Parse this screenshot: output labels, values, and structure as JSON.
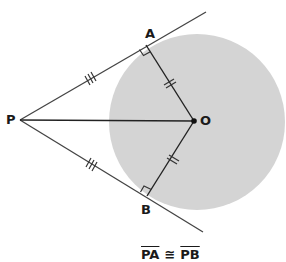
{
  "diagram": {
    "points": {
      "P": {
        "label": "P",
        "x": 20,
        "y": 120
      },
      "A": {
        "label": "A",
        "x": 146,
        "y": 45
      },
      "B": {
        "label": "B",
        "x": 147,
        "y": 196
      },
      "O": {
        "label": "O",
        "x": 194,
        "y": 121
      }
    },
    "circle": {
      "cx": 197,
      "cy": 122,
      "r": 88,
      "fill": "#d4d4d4"
    },
    "tangent_upper_end": {
      "x": 206,
      "y": 12
    },
    "tangent_lower_end": {
      "x": 203,
      "y": 232
    },
    "line_color": "#333333",
    "marks": {
      "PA": "triple-tick",
      "PB": "triple-tick",
      "OA": "double-tick",
      "OB": "double-tick",
      "angle_A": "right-angle",
      "angle_B": "right-angle"
    },
    "caption": {
      "left": "PA",
      "symbol": "≅",
      "right": "PB"
    }
  }
}
